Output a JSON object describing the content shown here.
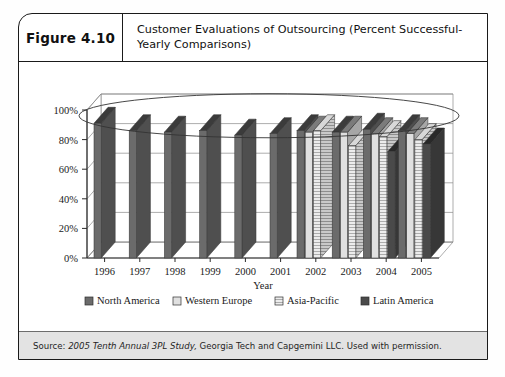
{
  "figure": {
    "number_label": "Figure 4.10",
    "title": "Customer Evaluations of Outsourcing (Percent Successful-Yearly Comparisons)",
    "source_prefix": "Source: ",
    "source_italic": "2005 Tenth Annual 3PL Study,",
    "source_rest": " Georgia Tech and Capgemini LLC. Used with permission."
  },
  "colors": {
    "north_america": "#6b6b6b",
    "western_europe": "#e0e0e0",
    "asia_pacific": "#bdbdbd",
    "latin_america": "#4a4a4a",
    "axis": "#2a2a2a",
    "grid": "#8a8a8a",
    "annotation_ellipse": "#333333",
    "source_background": "#e3e3e3"
  },
  "chart_data": {
    "type": "bar",
    "title": "Customer Evaluations of Outsourcing (Percent Successful-Yearly Comparisons)",
    "xlabel": "Year",
    "ylabel": "",
    "ylim": [
      0,
      100
    ],
    "ytick_labels": [
      "0%",
      "20%",
      "40%",
      "60%",
      "80%",
      "100%"
    ],
    "ytick_values": [
      0,
      20,
      40,
      60,
      80,
      100
    ],
    "grid": true,
    "legend_position": "bottom",
    "categories": [
      "1996",
      "1997",
      "1998",
      "1999",
      "2000",
      "2001",
      "2002",
      "2003",
      "2004",
      "2005"
    ],
    "series": [
      {
        "name": "North America",
        "values": [
          91,
          86,
          85,
          86,
          83,
          84,
          86,
          85,
          87,
          86
        ]
      },
      {
        "name": "Western Europe",
        "values": [
          null,
          null,
          null,
          null,
          null,
          null,
          85,
          85,
          84,
          84
        ]
      },
      {
        "name": "Asia-Pacific",
        "values": [
          null,
          null,
          null,
          null,
          null,
          null,
          86,
          76,
          82,
          80
        ]
      },
      {
        "name": "Latin America",
        "values": [
          null,
          null,
          null,
          null,
          null,
          null,
          null,
          null,
          72,
          77
        ]
      }
    ],
    "annotations": [
      {
        "type": "ellipse",
        "label": "highlight-ellipse-over-bar-tops"
      }
    ]
  },
  "legend": {
    "items": [
      {
        "label": "North America",
        "swatch": "north_america"
      },
      {
        "label": "Western Europe",
        "swatch": "western_europe"
      },
      {
        "label": "Asia-Pacific",
        "swatch": "asia_pacific"
      },
      {
        "label": "Latin America",
        "swatch": "latin_america"
      }
    ]
  }
}
